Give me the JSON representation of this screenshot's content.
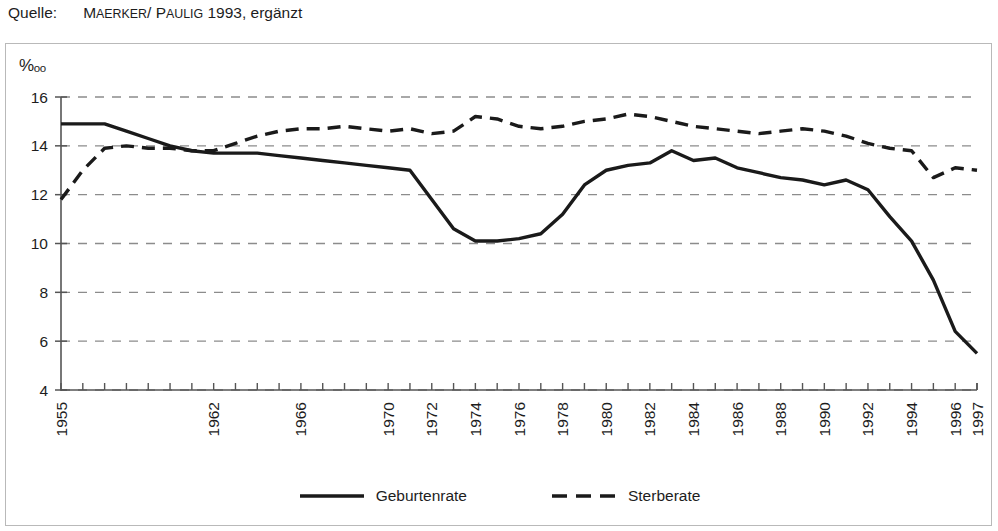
{
  "source": {
    "label": "Quelle:",
    "citation_first": "M",
    "citation_rest_1": "AERKER",
    "citation_sep": "/ P",
    "citation_rest_2": "AULIG",
    "citation_tail": " 1993, ergänzt",
    "full_text": "MAERKER / PAULIG 1993, ergänzt"
  },
  "axis": {
    "unit_symbol": "%",
    "unit_suffix": "oo",
    "unit_full": "‰"
  },
  "legend": {
    "items": [
      {
        "label": "Geburtenrate",
        "style": "solid",
        "color": "#1a1a1a"
      },
      {
        "label": "Sterberate",
        "style": "dashed",
        "color": "#1a1a1a"
      }
    ]
  },
  "colors": {
    "line": "#1a1a1a",
    "grid": "#8c8c8c",
    "axis": "#555555",
    "border": "#b9b9b9",
    "background": "#ffffff",
    "text": "#1d1d1d"
  },
  "chart_data": {
    "type": "line",
    "title": "",
    "subtitle": "",
    "xlabel": "",
    "ylabel": "‰",
    "ylim": [
      4,
      16
    ],
    "yticks": [
      4,
      6,
      8,
      10,
      12,
      14,
      16
    ],
    "ytick_labels": [
      "4",
      "6",
      "8",
      "10",
      "12",
      "14",
      "16"
    ],
    "grid": true,
    "grid_axis": "y",
    "grid_style": "dashed",
    "legend_position": "bottom-center",
    "xlim": [
      1955,
      1997
    ],
    "x": [
      1955,
      1956,
      1957,
      1958,
      1959,
      1960,
      1961,
      1962,
      1963,
      1964,
      1965,
      1966,
      1967,
      1968,
      1969,
      1970,
      1971,
      1972,
      1973,
      1974,
      1975,
      1976,
      1977,
      1978,
      1979,
      1980,
      1981,
      1982,
      1983,
      1984,
      1985,
      1986,
      1987,
      1988,
      1989,
      1990,
      1991,
      1992,
      1993,
      1994,
      1995,
      1996,
      1997
    ],
    "xtick_labels_shown": [
      "1955",
      "1962",
      "1966",
      "1970",
      "1972",
      "1974",
      "1976",
      "1978",
      "1980",
      "1982",
      "1984",
      "1986",
      "1988",
      "1990",
      "1992",
      "1994",
      "1996",
      "1997"
    ],
    "xticks_shown_values": [
      1955,
      1962,
      1966,
      1970,
      1972,
      1974,
      1976,
      1978,
      1980,
      1982,
      1984,
      1986,
      1988,
      1990,
      1992,
      1994,
      1996,
      1997
    ],
    "series": [
      {
        "name": "Geburtenrate",
        "style": "solid",
        "color": "#1a1a1a",
        "values": [
          14.9,
          14.9,
          14.9,
          14.6,
          14.3,
          14.0,
          13.8,
          13.7,
          13.7,
          13.7,
          13.6,
          13.5,
          13.4,
          13.3,
          13.2,
          13.1,
          13.0,
          11.8,
          10.6,
          10.1,
          10.1,
          10.2,
          10.4,
          11.2,
          12.4,
          13.0,
          13.2,
          13.3,
          13.8,
          13.4,
          13.5,
          13.1,
          12.9,
          12.7,
          12.6,
          12.4,
          12.6,
          12.2,
          11.1,
          10.1,
          8.5,
          6.4,
          5.5
        ]
      },
      {
        "name": "Sterberate",
        "style": "dashed",
        "color": "#1a1a1a",
        "values": [
          11.8,
          13.0,
          13.9,
          14.0,
          13.9,
          13.9,
          13.8,
          13.8,
          14.1,
          14.4,
          14.6,
          14.7,
          14.7,
          14.8,
          14.7,
          14.6,
          14.7,
          14.5,
          14.6,
          15.2,
          15.1,
          14.8,
          14.7,
          14.8,
          15.0,
          15.1,
          15.3,
          15.2,
          15.0,
          14.8,
          14.7,
          14.6,
          14.5,
          14.6,
          14.7,
          14.6,
          14.4,
          14.1,
          13.9,
          13.8,
          12.7,
          13.1,
          13.0
        ]
      }
    ],
    "series_note": "Geburtenrate drops sharply after 1988 to a minimum near 4.9 in 1994 then recovers to about 6.3 in 1997; Sterberate declines after 1990 to about 11.6 in 1997."
  },
  "geburtenrate_points": [
    14.9,
    14.9,
    14.9,
    14.6,
    14.3,
    14.0,
    13.8,
    13.7,
    13.7,
    13.7,
    13.6,
    13.5,
    13.4,
    13.3,
    13.2,
    13.1,
    13.0,
    11.8,
    10.6,
    10.1,
    10.1,
    10.2,
    10.4,
    11.2,
    12.4,
    13.0,
    13.2,
    13.3,
    13.8,
    13.4,
    13.5,
    13.1,
    12.9,
    12.7,
    12.6,
    12.4,
    12.6,
    12.2,
    11.1,
    10.1,
    8.5,
    6.4,
    5.5
  ],
  "sterberate_points": [
    11.8,
    13.0,
    13.9,
    14.0,
    13.9,
    13.9,
    13.8,
    13.8,
    14.1,
    14.4,
    14.6,
    14.7,
    14.7,
    14.8,
    14.7,
    14.6,
    14.7,
    14.5,
    14.6,
    15.2,
    15.1,
    14.8,
    14.7,
    14.8,
    15.0,
    15.1,
    15.3,
    15.2,
    15.0,
    14.8,
    14.7,
    14.6,
    14.5,
    14.6,
    14.7,
    14.6,
    14.4,
    14.1,
    13.9,
    13.8,
    12.7,
    13.1,
    13.0
  ]
}
